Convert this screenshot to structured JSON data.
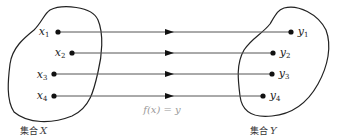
{
  "diagram": {
    "type": "function-mapping",
    "domain_set": {
      "label": "集合",
      "var": "X",
      "elements": [
        {
          "name": "x",
          "sub": "1",
          "cx": 58,
          "cy": 32
        },
        {
          "name": "x",
          "sub": "2",
          "cx": 72,
          "cy": 53
        },
        {
          "name": "x",
          "sub": "3",
          "cx": 54,
          "cy": 74
        },
        {
          "name": "x",
          "sub": "4",
          "cx": 54,
          "cy": 96
        }
      ]
    },
    "codomain_set": {
      "label": "集合",
      "var": "Y",
      "elements": [
        {
          "name": "y",
          "sub": "1",
          "cx": 291,
          "cy": 32
        },
        {
          "name": "y",
          "sub": "2",
          "cx": 273,
          "cy": 53
        },
        {
          "name": "y",
          "sub": "3",
          "cx": 272,
          "cy": 74
        },
        {
          "name": "y",
          "sub": "4",
          "cx": 263,
          "cy": 96
        }
      ]
    },
    "function_label": "f(x) = y",
    "colors": {
      "stroke": "#222222",
      "arrow_line": "#555555",
      "function_label": "#999999"
    }
  }
}
